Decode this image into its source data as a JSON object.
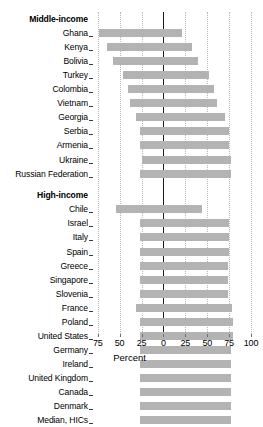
{
  "chart_data": {
    "type": "bar",
    "orientation": "horizontal",
    "title": "",
    "subtitle": "",
    "xlabel": "Percent",
    "ylabel": "",
    "xlim": [
      -85,
      105
    ],
    "xticks": [
      -75,
      -50,
      -25,
      0,
      25,
      50,
      75,
      100
    ],
    "xtick_labels": [
      "75",
      "50",
      "25",
      "0",
      "25",
      "50",
      "75",
      "100"
    ],
    "grid": "vertical-dotted",
    "legend": "none",
    "zero_line": true,
    "bar_color": "#b3b3b3",
    "groups": [
      {
        "label": "Middle-income",
        "categories": [
          "Ghana",
          "Kenya",
          "Bolivia",
          "Turkey",
          "Colombia",
          "Vietnam",
          "Georgia",
          "Serbia",
          "Armenia",
          "Ukraine",
          "Russian Federation"
        ],
        "bar_start": [
          -74,
          -64,
          -57,
          -46,
          -40,
          -38,
          -31,
          -27,
          -27,
          -25,
          -27
        ],
        "bar_end": [
          21,
          33,
          40,
          52,
          58,
          61,
          70,
          75,
          75,
          77,
          77
        ]
      },
      {
        "label": "High-income",
        "categories": [
          "Chile",
          "Israel",
          "Italy",
          "Spain",
          "Greece",
          "Singapore",
          "Slovenia",
          "France",
          "Poland",
          "United States",
          "Germany",
          "Ireland",
          "United Kingdom",
          "Canada",
          "Denmark",
          "Median, HICs"
        ],
        "bar_start": [
          -54,
          -27,
          -27,
          -27,
          -27,
          -27,
          -27,
          -31,
          -27,
          -27,
          -27,
          -27,
          -27,
          -27,
          -27,
          -27
        ],
        "bar_end": [
          44,
          75,
          75,
          75,
          74,
          74,
          74,
          78,
          79,
          79,
          77,
          77,
          77,
          77,
          77,
          77
        ]
      }
    ]
  }
}
